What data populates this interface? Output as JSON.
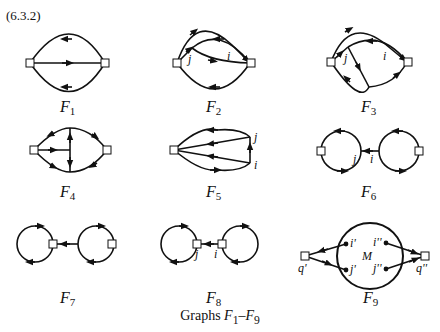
{
  "equation_number": "(6.3.2)",
  "caption": {
    "prefix": "Graphs ",
    "range_start": "F",
    "range_start_sub": "1",
    "dash": "–",
    "range_end": "F",
    "range_end_sub": "9"
  },
  "graphs": [
    {
      "id": "F1",
      "label": "F",
      "sub": "1"
    },
    {
      "id": "F2",
      "label": "F",
      "sub": "2",
      "vertex_labels": [
        "j",
        "i"
      ]
    },
    {
      "id": "F3",
      "label": "F",
      "sub": "3",
      "vertex_labels": [
        "j",
        "i"
      ]
    },
    {
      "id": "F4",
      "label": "F",
      "sub": "4"
    },
    {
      "id": "F5",
      "label": "F",
      "sub": "5",
      "vertex_labels": [
        "j",
        "i"
      ]
    },
    {
      "id": "F6",
      "label": "F",
      "sub": "6",
      "vertex_labels": [
        "j",
        "i"
      ]
    },
    {
      "id": "F7",
      "label": "F",
      "sub": "7"
    },
    {
      "id": "F8",
      "label": "F",
      "sub": "8",
      "vertex_labels": [
        "j",
        "i"
      ]
    },
    {
      "id": "F9",
      "label": "F",
      "sub": "9",
      "vertex_labels": [
        "i'",
        "j'",
        "i''",
        "j''",
        "q'",
        "q''",
        "M"
      ]
    }
  ]
}
